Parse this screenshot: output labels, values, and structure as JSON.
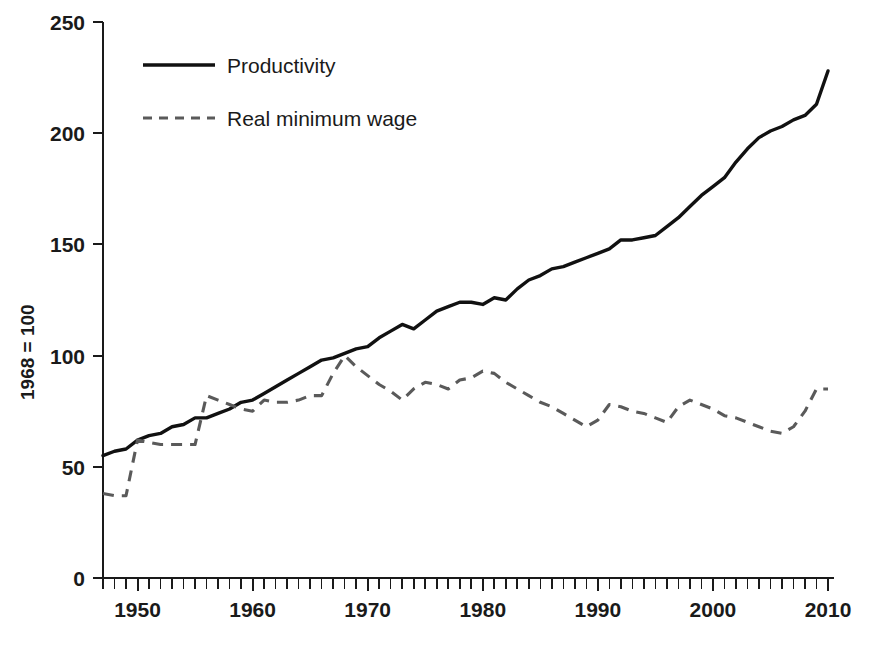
{
  "chart_data": {
    "type": "line",
    "title": "",
    "xlabel": "",
    "ylabel": "1968 = 100",
    "xlim": [
      1947,
      2010
    ],
    "ylim": [
      0,
      250
    ],
    "grid": false,
    "legend_position": "top-left",
    "y_ticks": [
      0,
      50,
      100,
      150,
      200,
      250
    ],
    "y_tick_labels": [
      "0",
      "50",
      "100",
      "150",
      "200",
      "250"
    ],
    "x_ticks": [
      1950,
      1960,
      1970,
      1980,
      1990,
      2000,
      2010
    ],
    "x_tick_labels": [
      "1950",
      "1960",
      "1970",
      "1980",
      "1990",
      "2000",
      "2010"
    ],
    "x_minor_tick_interval": 1,
    "x": [
      1947,
      1948,
      1949,
      1950,
      1951,
      1952,
      1953,
      1954,
      1955,
      1956,
      1957,
      1958,
      1959,
      1960,
      1961,
      1962,
      1963,
      1964,
      1965,
      1966,
      1967,
      1968,
      1969,
      1970,
      1971,
      1972,
      1973,
      1974,
      1975,
      1976,
      1977,
      1978,
      1979,
      1980,
      1981,
      1982,
      1983,
      1984,
      1985,
      1986,
      1987,
      1988,
      1989,
      1990,
      1991,
      1992,
      1993,
      1994,
      1995,
      1996,
      1997,
      1998,
      1999,
      2000,
      2001,
      2002,
      2003,
      2004,
      2005,
      2006,
      2007,
      2008,
      2009,
      2010
    ],
    "series": [
      {
        "name": "Productivity",
        "style": "solid",
        "color": "#111111",
        "values": [
          55,
          57,
          58,
          62,
          64,
          65,
          68,
          69,
          72,
          72,
          74,
          76,
          79,
          80,
          83,
          86,
          89,
          92,
          95,
          98,
          99,
          101,
          103,
          104,
          108,
          111,
          114,
          112,
          116,
          120,
          122,
          124,
          124,
          123,
          126,
          125,
          130,
          134,
          136,
          139,
          140,
          142,
          144,
          146,
          148,
          152,
          152,
          153,
          154,
          158,
          162,
          167,
          172,
          176,
          180,
          187,
          193,
          198,
          201,
          203,
          206,
          208,
          213,
          228
        ]
      },
      {
        "name": "Real minimum wage",
        "style": "dashed",
        "color": "#5a5a5a",
        "values": [
          38,
          37,
          37,
          62,
          61,
          60,
          60,
          60,
          60,
          82,
          80,
          78,
          76,
          75,
          80,
          79,
          79,
          80,
          82,
          82,
          92,
          100,
          95,
          91,
          87,
          84,
          80,
          85,
          88,
          87,
          85,
          89,
          90,
          93,
          92,
          88,
          85,
          82,
          79,
          77,
          74,
          71,
          68,
          71,
          78,
          77,
          75,
          74,
          72,
          70,
          77,
          80,
          78,
          76,
          73,
          72,
          70,
          68,
          66,
          65,
          68,
          75,
          85,
          85
        ]
      }
    ]
  },
  "axes": {
    "y_axis_title": "1968 = 100"
  },
  "legend": {
    "items": [
      {
        "label": "Productivity",
        "style": "solid"
      },
      {
        "label": "Real minimum wage",
        "style": "dashed"
      }
    ]
  }
}
